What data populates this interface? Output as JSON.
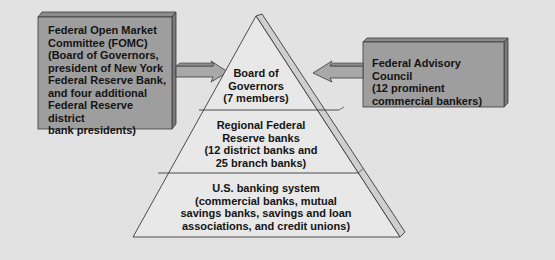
{
  "colors": {
    "background": "#e2e2e2",
    "box_fill": "#9e9e9e",
    "box_top": "#8c8c8c",
    "box_side": "#7a7a7a",
    "pyramid_fill": "#e8e8e8",
    "pyramid_side": "#cfcfcf",
    "arrow_fill": "#a8a8a8",
    "outline": "#3a3a3a",
    "text": "#141414"
  },
  "boxes": {
    "fomc": {
      "title": "Federal Open Market Committee (FOMC)",
      "text": "Federal Open Market\nCommittee (FOMC)\n(Board of Governors,\npresident of New York\nFederal Reserve Bank,\nand four additional\nFederal Reserve district\nbank presidents)"
    },
    "advisory": {
      "title": "Federal Advisory Council",
      "text": "Federal Advisory Council\n(12 prominent\ncommercial bankers)"
    }
  },
  "pyramid": {
    "tiers": [
      {
        "name": "Board of Governors",
        "text": "Board of\nGovernors\n(7 members)"
      },
      {
        "name": "Regional Federal Reserve banks",
        "text": "Regional Federal\nReserve banks\n(12 district banks and\n25 branch banks)"
      },
      {
        "name": "U.S. banking system",
        "text": "U.S. banking system\n(commercial banks, mutual\nsavings banks, savings and loan\nassociations, and credit unions)"
      }
    ]
  },
  "arrows": [
    {
      "from": "fomc",
      "to": "Board of Governors",
      "direction": "right"
    },
    {
      "from": "advisory",
      "to": "Board of Governors",
      "direction": "left"
    }
  ]
}
